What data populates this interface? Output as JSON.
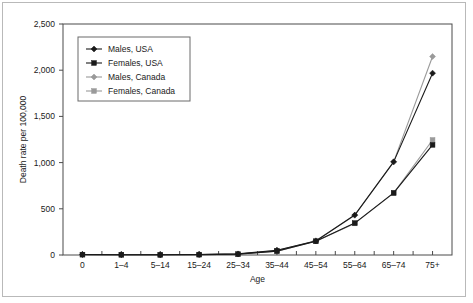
{
  "chart_data": {
    "type": "line",
    "title": "",
    "xlabel": "Age",
    "ylabel": "Death rate per 100,000",
    "categories": [
      "0",
      "1–4",
      "5–14",
      "15–24",
      "25–34",
      "35–44",
      "45–54",
      "55–64",
      "65–74",
      "75+"
    ],
    "ylim": [
      0,
      2500
    ],
    "yticks": [
      0,
      500,
      1000,
      1500,
      2000,
      2500
    ],
    "ytick_labels": [
      "0",
      "500",
      "1,000",
      "1,500",
      "2,000",
      "2,500"
    ],
    "grid": false,
    "legend_position": "upper-left-inside",
    "series": [
      {
        "name": "Males, USA",
        "color": "#1a1a1a",
        "marker": "diamond",
        "values": [
          5,
          3,
          3,
          6,
          12,
          52,
          152,
          432,
          1008,
          1968
        ]
      },
      {
        "name": "Females, USA",
        "color": "#1a1a1a",
        "marker": "square",
        "values": [
          4,
          3,
          2,
          4,
          9,
          42,
          148,
          345,
          672,
          1192
        ]
      },
      {
        "name": "Males, Canada",
        "color": "#9a9a9a",
        "marker": "diamond",
        "values": [
          5,
          3,
          3,
          5,
          10,
          48,
          155,
          430,
          1008,
          2148
        ]
      },
      {
        "name": "Females, Canada",
        "color": "#9a9a9a",
        "marker": "square",
        "values": [
          4,
          2,
          2,
          4,
          8,
          40,
          150,
          342,
          670,
          1245
        ]
      }
    ]
  }
}
